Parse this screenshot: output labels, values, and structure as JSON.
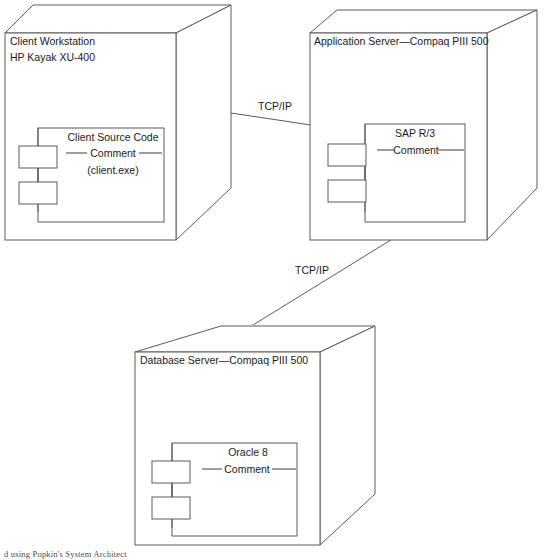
{
  "diagram": {
    "type": "uml-deployment-diagram",
    "caption": "d using Popkin's System Architect",
    "stroke_color": "#5a5a5a",
    "text_color": "#1a1a1a",
    "background_color": "#ffffff"
  },
  "nodes": [
    {
      "id": "client-workstation",
      "title_line1": "Client Workstation",
      "title_line2": "HP Kayak XU-400",
      "component": {
        "name": "Client Source Code",
        "comment_label": "Comment",
        "subtitle": "(client.exe)"
      }
    },
    {
      "id": "application-server",
      "title_line1": "Application Server—Compaq PIII 500",
      "title_line2": "",
      "component": {
        "name": "SAP R/3",
        "comment_label": "Comment",
        "subtitle": ""
      }
    },
    {
      "id": "database-server",
      "title_line1": "Database Server—Compaq PIII 500",
      "title_line2": "",
      "component": {
        "name": "Oracle 8",
        "comment_label": "Comment",
        "subtitle": ""
      }
    }
  ],
  "connections": [
    {
      "id": "client-to-appserver",
      "label": "TCP/IP",
      "from": "client-workstation",
      "to": "application-server"
    },
    {
      "id": "appserver-to-dbserver",
      "label": "TCP/IP",
      "from": "application-server",
      "to": "database-server"
    }
  ]
}
